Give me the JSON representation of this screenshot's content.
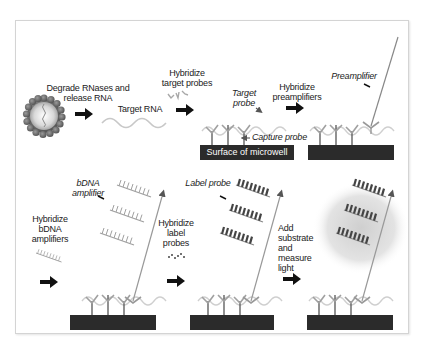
{
  "diagram": {
    "colors": {
      "well": "#2b2b2b",
      "arrow": "#111111",
      "probe_gray": "#9a9a9a",
      "rna_gray": "#c8c8c8",
      "glow": "#d9d9d9"
    },
    "top_row": {
      "step1_label": [
        "Degrade RNases and",
        "release RNA"
      ],
      "target_rna_label": "Target RNA",
      "step2_label": [
        "Hybridize",
        "target probes"
      ],
      "target_probe_callout": [
        "Target",
        "probe"
      ],
      "capture_probe_callout": "Capture probe",
      "well_label": "Surface of microwell",
      "step3_label": [
        "Hybridize",
        "preamplifiers"
      ],
      "preamplifier_callout": "Preamplifier"
    },
    "bottom_row": {
      "step4_label": [
        "Hybridize",
        "bDNA",
        "amplifiers"
      ],
      "bdna_callout": [
        "bDNA",
        "amplifier"
      ],
      "step5_label": [
        "Hybridize",
        "label",
        "probes"
      ],
      "label_probe_callout": "Label probe",
      "step6_label": [
        "Add",
        "substrate",
        "and measure",
        "light"
      ]
    },
    "icons": [
      "cell-icon",
      "arrow-right-icon",
      "rna-strand-icon",
      "probe-icon",
      "microwell-icon",
      "preamplifier-icon",
      "bdna-amplifier-icon",
      "label-probe-icon",
      "light-glow-icon"
    ]
  }
}
